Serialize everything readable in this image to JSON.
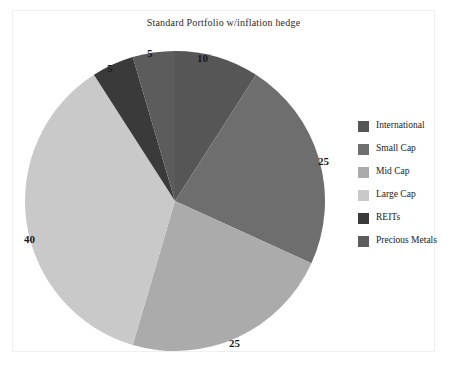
{
  "chart_data": {
    "type": "pie",
    "title": "Standard Portfolio w/inflation hedge",
    "categories": [
      "International",
      "Small Cap",
      "Mid Cap",
      "Large Cap",
      "REITs",
      "Precious Metals"
    ],
    "values": [
      10,
      25,
      25,
      40,
      5,
      5
    ],
    "labels": [
      "10",
      "25",
      "25",
      "40",
      "5",
      "5"
    ],
    "colors": [
      "#565656",
      "#6e6e6e",
      "#ababab",
      "#c9c9c9",
      "#3a3a3a",
      "#5c5c5c"
    ],
    "start_angle": 0,
    "direction": "clockwise",
    "legend_position": "right",
    "grid": false,
    "xlabel": "",
    "ylabel": ""
  },
  "legend": {
    "entries": [
      {
        "label": "International",
        "color": "#565656"
      },
      {
        "label": "Small Cap",
        "color": "#6e6e6e"
      },
      {
        "label": "Mid Cap",
        "color": "#ababab"
      },
      {
        "label": "Large Cap",
        "color": "#c9c9c9"
      },
      {
        "label": "REITs",
        "color": "#3a3a3a"
      },
      {
        "label": "Precious Metals",
        "color": "#5c5c5c"
      }
    ]
  },
  "value_labels": [
    {
      "text": "10",
      "left": 197,
      "top": 52
    },
    {
      "text": "25",
      "left": 318,
      "top": 155
    },
    {
      "text": "25",
      "left": 229,
      "top": 337
    },
    {
      "text": "40",
      "left": 24,
      "top": 233
    },
    {
      "text": "5",
      "left": 147,
      "top": 47
    },
    {
      "text": "5",
      "left": 107,
      "top": 62
    }
  ]
}
